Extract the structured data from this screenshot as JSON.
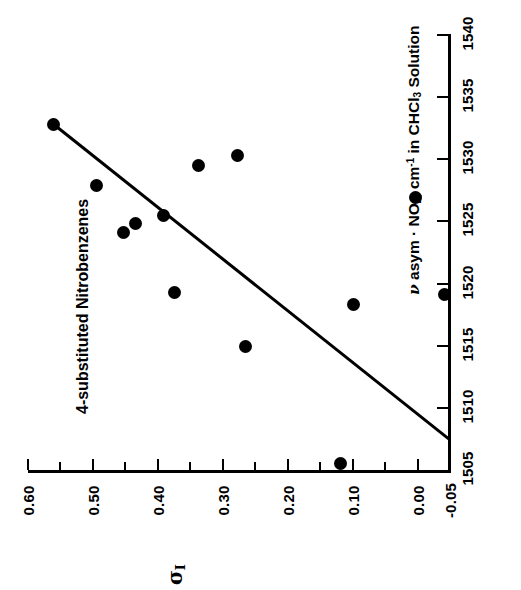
{
  "figure": {
    "title": "4-substituted Nitrobenzenes",
    "orientation": "rotated-90-ccw",
    "background_color": "#ffffff",
    "ink_color": "#000000"
  },
  "chart_data": {
    "type": "scatter",
    "title": "4-substituted Nitrobenzenes",
    "xlabel": "ν asym · NO2, cm-1 in CHCl3 Solution",
    "xlabel_parts": {
      "greek": "ν",
      "text_before_sub1": " asym · NO",
      "sub1": "2",
      "text_after_sub1": ", cm",
      "sup1": "-1",
      "text_after_sup1": " in CHCl",
      "sub2": "3",
      "text_end": " Solution"
    },
    "ylabel": "σI",
    "ylabel_parts": {
      "base": "σ",
      "sub": "I"
    },
    "xlim": [
      1505,
      1540
    ],
    "ylim": [
      -0.05,
      0.6
    ],
    "grid": false,
    "legend": null,
    "x_major_ticks": [
      1505,
      1510,
      1515,
      1520,
      1525,
      1530,
      1535,
      1540
    ],
    "x_major_tick_labels": [
      "1505",
      "1510",
      "1515",
      "1520",
      "1525",
      "1530",
      "1535",
      "1540"
    ],
    "x_minor_ticks": [],
    "y_major_ticks": [
      -0.05,
      0.0,
      0.1,
      0.2,
      0.3,
      0.4,
      0.5,
      0.6
    ],
    "y_major_tick_labels": [
      "-0.05",
      "0.00",
      "0.10",
      "0.20",
      "0.30",
      "0.40",
      "0.50",
      "0.60"
    ],
    "y_minor_ticks": [
      0.05,
      0.15,
      0.25,
      0.35,
      0.45,
      0.55
    ],
    "marker": {
      "shape": "circle",
      "filled": true,
      "color": "#000000",
      "size_px": 13
    },
    "points": [
      {
        "x": 1532.8,
        "y": 0.56
      },
      {
        "x": 1527.9,
        "y": 0.495
      },
      {
        "x": 1524.1,
        "y": 0.453
      },
      {
        "x": 1524.8,
        "y": 0.435
      },
      {
        "x": 1525.5,
        "y": 0.392
      },
      {
        "x": 1529.5,
        "y": 0.338
      },
      {
        "x": 1530.3,
        "y": 0.278
      },
      {
        "x": 1519.3,
        "y": 0.375
      },
      {
        "x": 1514.9,
        "y": 0.265
      },
      {
        "x": 1505.5,
        "y": 0.118
      },
      {
        "x": 1518.3,
        "y": 0.098
      },
      {
        "x": 1526.9,
        "y": 0.003
      },
      {
        "x": 1519.1,
        "y": -0.042
      }
    ],
    "trend_line": {
      "type": "linear-fit",
      "color": "#000000",
      "width_px": 3,
      "start": {
        "x": 1533.0,
        "y": 0.565
      },
      "end": {
        "x": 1507.5,
        "y": -0.048
      }
    }
  }
}
